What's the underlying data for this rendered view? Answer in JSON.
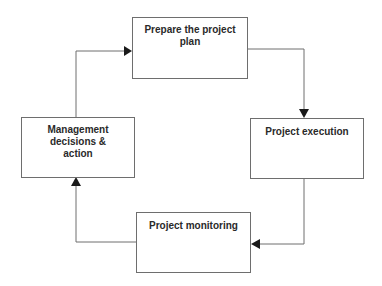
{
  "diagram": {
    "type": "cycle-flowchart",
    "nodes": [
      {
        "id": "plan",
        "label": "Prepare the project plan"
      },
      {
        "id": "execution",
        "label": "Project execution"
      },
      {
        "id": "monitoring",
        "label": "Project monitoring"
      },
      {
        "id": "management",
        "label": "Management decisions & action"
      }
    ],
    "edges": [
      {
        "from": "plan",
        "to": "execution"
      },
      {
        "from": "execution",
        "to": "monitoring"
      },
      {
        "from": "monitoring",
        "to": "management"
      },
      {
        "from": "management",
        "to": "plan"
      }
    ],
    "colors": {
      "line": "#6e6e6e",
      "arrow": "#1a1a1a",
      "text": "#2a2a2a",
      "background": "#ffffff"
    }
  }
}
